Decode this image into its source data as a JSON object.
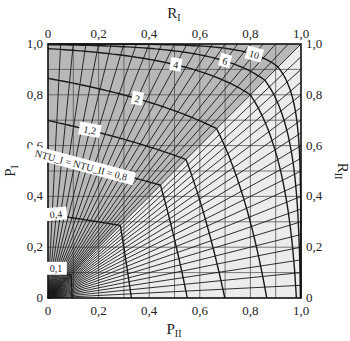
{
  "chart_data": {
    "type": "line",
    "title": "",
    "plot_box": {
      "left": 48,
      "top": 44,
      "right": 301,
      "bottom": 298
    },
    "x_bottom": {
      "label": "P_II",
      "ticks": [
        "0",
        "0,2",
        "0,4",
        "0,6",
        "0,8",
        "1,0"
      ],
      "range": [
        0,
        1
      ]
    },
    "x_top": {
      "label": "R_I",
      "ticks": [
        "0",
        "0,2",
        "0,4",
        "0,6",
        "0,8",
        "1,0"
      ],
      "range": [
        0,
        1
      ]
    },
    "y_left": {
      "label": "P_I",
      "ticks": [
        "0",
        "0,2",
        "0,4",
        "0,6",
        "0,8",
        "1,0"
      ],
      "range": [
        0,
        1
      ]
    },
    "y_right": {
      "label": "R_II",
      "ticks": [
        "0",
        "0,2",
        "0,4",
        "0,6",
        "0,8",
        "1,0"
      ],
      "range": [
        0,
        1
      ]
    },
    "grid": {
      "on": true,
      "step": 0.1
    },
    "colors": {
      "upper_region": "#b8b8b8",
      "lower_region": "#ececec",
      "lines": "#1a1a1a",
      "grid": "#555555"
    },
    "ntu_curves": [
      {
        "label": "0,1",
        "ntu": 0.1
      },
      {
        "label": "0,4",
        "ntu": 0.4
      },
      {
        "label": "NTU_I = NTU_II = 0,8",
        "ntu": 0.8
      },
      {
        "label": "1,2",
        "ntu": 1.2
      },
      {
        "label": "2",
        "ntu": 2
      },
      {
        "label": "4",
        "ntu": 4
      },
      {
        "label": "6",
        "ntu": 6
      },
      {
        "label": "10",
        "ntu": 10
      }
    ],
    "r_lines_count": 20,
    "annotations": [
      "0,1",
      "0,4",
      "NTU_I = NTU_II = 0,8",
      "1,2",
      "2",
      "4",
      "6",
      "10"
    ]
  },
  "labels": {
    "x_bottom": "P",
    "x_bottom_sub": "II",
    "x_top": "R",
    "x_top_sub": "I",
    "y_left": "P",
    "y_left_sub": "I",
    "y_right": "R",
    "y_right_sub": "II"
  }
}
